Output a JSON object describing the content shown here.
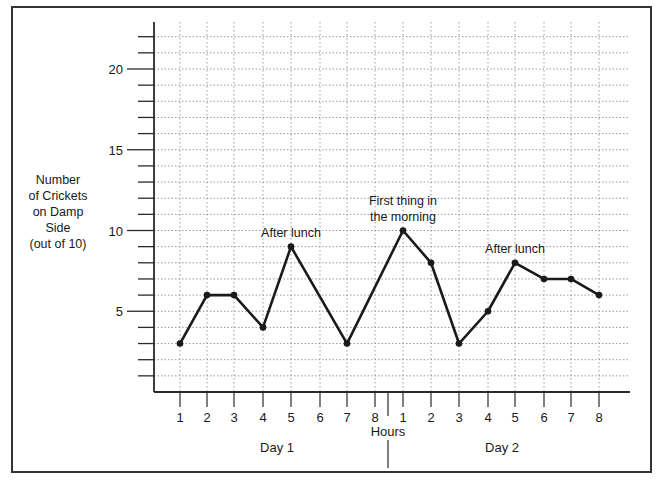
{
  "chart_data": {
    "type": "line",
    "title": "",
    "ylabel": "Number of Crickets on Damp Side (out of 10)",
    "ylabel_lines": [
      "Number",
      "of Crickets",
      "on Damp",
      "Side",
      "(out of 10)"
    ],
    "xlabel": "Hours",
    "ylim": [
      0,
      22
    ],
    "yticks_labeled": [
      5,
      10,
      15,
      20
    ],
    "grid": true,
    "groups": [
      {
        "name": "Day 1",
        "hours": [
          1,
          2,
          3,
          4,
          5,
          6,
          7,
          8
        ]
      },
      {
        "name": "Day 2",
        "hours": [
          1,
          2,
          3,
          4,
          5,
          6,
          7,
          8
        ]
      }
    ],
    "x": [
      "D1-1",
      "D1-2",
      "D1-3",
      "D1-4",
      "D1-5",
      "D1-7",
      "D2-1",
      "D2-2",
      "D2-3",
      "D2-4",
      "D2-5",
      "D2-6",
      "D2-7",
      "D2-8"
    ],
    "series": [
      {
        "name": "Crickets on damp side",
        "points": [
          {
            "day": 1,
            "hour": 1,
            "value": 3
          },
          {
            "day": 1,
            "hour": 2,
            "value": 6
          },
          {
            "day": 1,
            "hour": 3,
            "value": 6
          },
          {
            "day": 1,
            "hour": 4,
            "value": 4
          },
          {
            "day": 1,
            "hour": 5,
            "value": 9
          },
          {
            "day": 1,
            "hour": 7,
            "value": 3
          },
          {
            "day": 2,
            "hour": 1,
            "value": 10
          },
          {
            "day": 2,
            "hour": 2,
            "value": 8
          },
          {
            "day": 2,
            "hour": 3,
            "value": 3
          },
          {
            "day": 2,
            "hour": 4,
            "value": 5
          },
          {
            "day": 2,
            "hour": 5,
            "value": 8
          },
          {
            "day": 2,
            "hour": 6,
            "value": 7
          },
          {
            "day": 2,
            "hour": 7,
            "value": 7
          },
          {
            "day": 2,
            "hour": 8,
            "value": 6
          }
        ]
      }
    ],
    "annotations": [
      {
        "text": "After lunch",
        "day": 1,
        "hour": 5
      },
      {
        "text": "First thing in the morning",
        "lines": [
          "First thing in",
          "the morning"
        ],
        "day": 2,
        "hour": 1
      },
      {
        "text": "After lunch",
        "day": 2,
        "hour": 5
      }
    ]
  },
  "labels": {
    "xlabel": "Hours",
    "day1": "Day 1",
    "day2": "Day 2"
  }
}
